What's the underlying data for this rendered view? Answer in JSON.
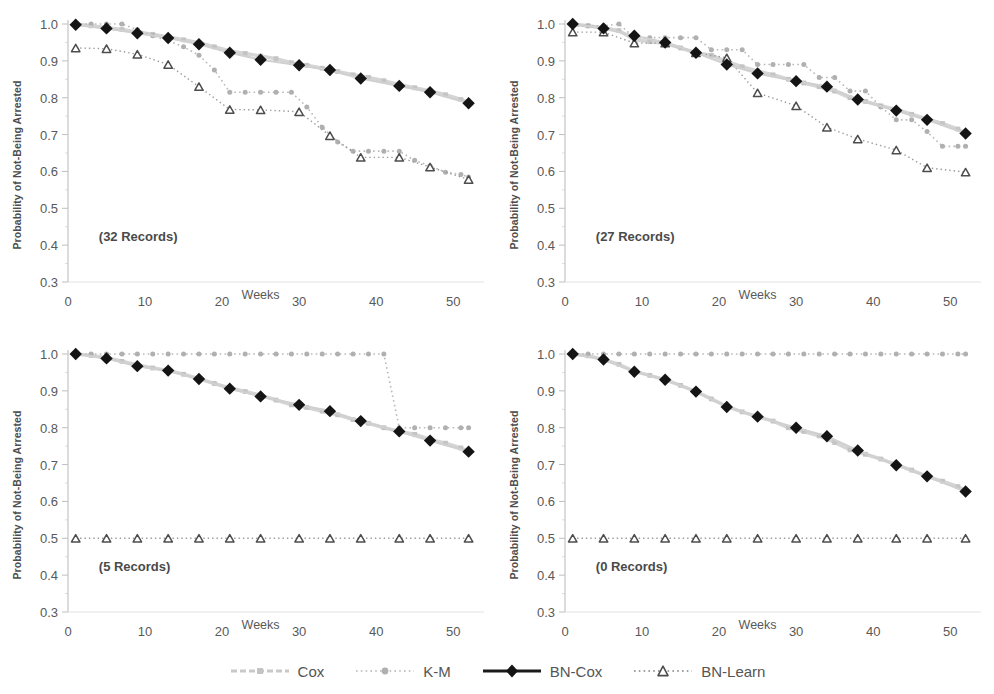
{
  "figure": {
    "axis_label_y": "Probability of Not-Being Arrested",
    "axis_label_x": "Weeks"
  },
  "legend": {
    "items": [
      {
        "label": "Cox",
        "marker": "square",
        "line": "dash",
        "color": "#c9c9c9"
      },
      {
        "label": "K-M",
        "marker": "circle",
        "line": "dot",
        "color": "#b4b4b4"
      },
      {
        "label": "BN-Cox",
        "marker": "diamond",
        "line": "solid",
        "color": "#1a1a1a"
      },
      {
        "label": "BN-Learn",
        "marker": "triangle",
        "line": "dot",
        "color": "#808080"
      }
    ]
  },
  "chart_data": [
    {
      "type": "line",
      "title": "(32 Records)",
      "xlabel": "Weeks",
      "ylabel": "Probability of Not-Being Arrested",
      "xlim": [
        0,
        54
      ],
      "ylim": [
        0.3,
        1.0
      ],
      "xticks": [
        0,
        10,
        20,
        30,
        40,
        50
      ],
      "yticks": [
        0.3,
        0.4,
        0.5,
        0.6,
        0.7,
        0.8,
        0.9,
        1.0
      ],
      "grid": false,
      "legend_position": "bottom",
      "series": [
        {
          "name": "Cox",
          "x": [
            1,
            3,
            5,
            7,
            9,
            11,
            13,
            15,
            17,
            19,
            21,
            23,
            25,
            27,
            29,
            31,
            33,
            35,
            37,
            39,
            41,
            43,
            45,
            47,
            49,
            51,
            52
          ],
          "y": [
            1.0,
            0.995,
            0.99,
            0.985,
            0.978,
            0.972,
            0.965,
            0.957,
            0.949,
            0.938,
            0.927,
            0.92,
            0.913,
            0.906,
            0.895,
            0.888,
            0.88,
            0.871,
            0.862,
            0.855,
            0.846,
            0.835,
            0.827,
            0.818,
            0.808,
            0.795,
            0.786
          ]
        },
        {
          "name": "K-M",
          "x": [
            1,
            3,
            5,
            7,
            9,
            11,
            13,
            15,
            17,
            19,
            21,
            23,
            25,
            27,
            29,
            31,
            33,
            35,
            37,
            39,
            41,
            43,
            45,
            47,
            49,
            51,
            52
          ],
          "y": [
            1.0,
            1.0,
            1.0,
            1.0,
            0.985,
            0.968,
            0.955,
            0.938,
            0.915,
            0.875,
            0.815,
            0.815,
            0.815,
            0.815,
            0.815,
            0.775,
            0.72,
            0.68,
            0.655,
            0.655,
            0.655,
            0.655,
            0.63,
            0.615,
            0.598,
            0.592,
            0.585
          ]
        },
        {
          "name": "BN-Cox",
          "x": [
            1,
            5,
            9,
            13,
            17,
            21,
            25,
            30,
            34,
            38,
            43,
            47,
            52
          ],
          "y": [
            0.998,
            0.988,
            0.975,
            0.962,
            0.945,
            0.922,
            0.903,
            0.888,
            0.875,
            0.852,
            0.832,
            0.815,
            0.785
          ]
        },
        {
          "name": "BN-Learn",
          "x": [
            1,
            5,
            9,
            13,
            17,
            21,
            25,
            30,
            34,
            38,
            43,
            47,
            52
          ],
          "y": [
            0.935,
            0.933,
            0.918,
            0.89,
            0.83,
            0.768,
            0.767,
            0.762,
            0.697,
            0.638,
            0.638,
            0.612,
            0.578
          ]
        }
      ]
    },
    {
      "type": "line",
      "title": "(27 Records)",
      "xlabel": "Weeks",
      "ylabel": "Probability of Not-Being Arrested",
      "xlim": [
        0,
        54
      ],
      "ylim": [
        0.3,
        1.0
      ],
      "xticks": [
        0,
        10,
        20,
        30,
        40,
        50
      ],
      "yticks": [
        0.3,
        0.4,
        0.5,
        0.6,
        0.7,
        0.8,
        0.9,
        1.0
      ],
      "grid": false,
      "legend_position": "bottom",
      "series": [
        {
          "name": "Cox",
          "x": [
            1,
            3,
            5,
            7,
            9,
            11,
            13,
            15,
            17,
            19,
            21,
            23,
            25,
            27,
            29,
            31,
            33,
            35,
            37,
            39,
            41,
            43,
            45,
            47,
            49,
            51,
            52
          ],
          "y": [
            1.0,
            0.995,
            0.99,
            0.982,
            0.958,
            0.952,
            0.948,
            0.935,
            0.922,
            0.915,
            0.898,
            0.884,
            0.872,
            0.862,
            0.85,
            0.84,
            0.83,
            0.818,
            0.8,
            0.79,
            0.778,
            0.768,
            0.755,
            0.742,
            0.73,
            0.715,
            0.703
          ]
        },
        {
          "name": "K-M",
          "x": [
            1,
            3,
            5,
            7,
            9,
            11,
            13,
            15,
            17,
            19,
            21,
            23,
            25,
            27,
            29,
            31,
            33,
            35,
            37,
            39,
            41,
            43,
            45,
            47,
            49,
            51,
            52
          ],
          "y": [
            0.995,
            0.995,
            0.995,
            1.0,
            0.963,
            0.963,
            0.963,
            0.963,
            0.963,
            0.93,
            0.93,
            0.93,
            0.89,
            0.89,
            0.89,
            0.89,
            0.855,
            0.855,
            0.818,
            0.818,
            0.775,
            0.74,
            0.74,
            0.708,
            0.668,
            0.668,
            0.668
          ]
        },
        {
          "name": "BN-Cox",
          "x": [
            1,
            5,
            9,
            13,
            17,
            21,
            25,
            30,
            34,
            38,
            43,
            47,
            52
          ],
          "y": [
            1.0,
            0.988,
            0.968,
            0.95,
            0.922,
            0.89,
            0.866,
            0.845,
            0.83,
            0.795,
            0.765,
            0.74,
            0.703
          ]
        },
        {
          "name": "BN-Learn",
          "x": [
            1,
            5,
            9,
            13,
            17,
            21,
            25,
            30,
            34,
            38,
            43,
            47,
            52
          ],
          "y": [
            0.978,
            0.978,
            0.948,
            0.948,
            0.922,
            0.908,
            0.813,
            0.778,
            0.72,
            0.688,
            0.658,
            0.61,
            0.598
          ]
        }
      ]
    },
    {
      "type": "line",
      "title": "(5 Records)",
      "xlabel": "Weeks",
      "ylabel": "Probability of Not-Being Arrested",
      "xlim": [
        0,
        54
      ],
      "ylim": [
        0.3,
        1.0
      ],
      "xticks": [
        0,
        10,
        20,
        30,
        40,
        50
      ],
      "yticks": [
        0.3,
        0.4,
        0.5,
        0.6,
        0.7,
        0.8,
        0.9,
        1.0
      ],
      "grid": false,
      "legend_position": "bottom",
      "series": [
        {
          "name": "Cox",
          "x": [
            1,
            3,
            5,
            7,
            9,
            11,
            13,
            15,
            17,
            19,
            21,
            23,
            25,
            27,
            29,
            31,
            33,
            35,
            37,
            39,
            41,
            43,
            45,
            47,
            49,
            51,
            52
          ],
          "y": [
            1.0,
            0.996,
            0.99,
            0.98,
            0.97,
            0.962,
            0.955,
            0.945,
            0.933,
            0.92,
            0.908,
            0.898,
            0.888,
            0.875,
            0.862,
            0.855,
            0.845,
            0.835,
            0.822,
            0.812,
            0.8,
            0.79,
            0.782,
            0.768,
            0.758,
            0.745,
            0.735
          ]
        },
        {
          "name": "K-M",
          "x": [
            1,
            3,
            5,
            7,
            9,
            11,
            13,
            15,
            17,
            19,
            21,
            23,
            25,
            27,
            29,
            31,
            33,
            35,
            37,
            39,
            41,
            43,
            45,
            47,
            49,
            51,
            52
          ],
          "y": [
            1.0,
            1.0,
            1.0,
            1.0,
            1.0,
            1.0,
            1.0,
            1.0,
            1.0,
            1.0,
            1.0,
            1.0,
            1.0,
            1.0,
            1.0,
            1.0,
            1.0,
            1.0,
            1.0,
            1.0,
            1.0,
            0.8,
            0.8,
            0.8,
            0.8,
            0.8,
            0.8
          ]
        },
        {
          "name": "BN-Cox",
          "x": [
            1,
            5,
            9,
            13,
            17,
            21,
            25,
            30,
            34,
            38,
            43,
            47,
            52
          ],
          "y": [
            1.0,
            0.988,
            0.967,
            0.955,
            0.932,
            0.906,
            0.885,
            0.862,
            0.845,
            0.818,
            0.79,
            0.765,
            0.735
          ]
        },
        {
          "name": "BN-Learn",
          "x": [
            1,
            5,
            9,
            13,
            17,
            21,
            25,
            30,
            34,
            38,
            43,
            47,
            52
          ],
          "y": [
            0.5,
            0.5,
            0.5,
            0.5,
            0.5,
            0.5,
            0.5,
            0.5,
            0.5,
            0.5,
            0.5,
            0.5,
            0.5
          ]
        }
      ]
    },
    {
      "type": "line",
      "title": "(0 Records)",
      "xlabel": "Weeks",
      "ylabel": "Probability of Not-Being Arrested",
      "xlim": [
        0,
        54
      ],
      "ylim": [
        0.3,
        1.0
      ],
      "xticks": [
        0,
        10,
        20,
        30,
        40,
        50
      ],
      "yticks": [
        0.3,
        0.4,
        0.5,
        0.6,
        0.7,
        0.8,
        0.9,
        1.0
      ],
      "grid": false,
      "legend_position": "bottom",
      "series": [
        {
          "name": "Cox",
          "x": [
            1,
            3,
            5,
            7,
            9,
            11,
            13,
            15,
            17,
            19,
            21,
            23,
            25,
            27,
            29,
            31,
            33,
            35,
            37,
            39,
            41,
            43,
            45,
            47,
            49,
            51,
            52
          ],
          "y": [
            1.0,
            0.995,
            0.985,
            0.972,
            0.953,
            0.942,
            0.93,
            0.915,
            0.898,
            0.878,
            0.858,
            0.843,
            0.83,
            0.818,
            0.8,
            0.79,
            0.778,
            0.76,
            0.74,
            0.728,
            0.715,
            0.7,
            0.685,
            0.668,
            0.655,
            0.64,
            0.628
          ]
        },
        {
          "name": "K-M",
          "x": [
            1,
            3,
            5,
            7,
            9,
            11,
            13,
            15,
            17,
            19,
            21,
            23,
            25,
            27,
            29,
            31,
            33,
            35,
            37,
            39,
            41,
            43,
            45,
            47,
            49,
            51,
            52
          ],
          "y": [
            1.0,
            1.0,
            1.0,
            1.0,
            1.0,
            1.0,
            1.0,
            1.0,
            1.0,
            1.0,
            1.0,
            1.0,
            1.0,
            1.0,
            1.0,
            1.0,
            1.0,
            1.0,
            1.0,
            1.0,
            1.0,
            1.0,
            1.0,
            1.0,
            1.0,
            1.0,
            1.0
          ]
        },
        {
          "name": "BN-Cox",
          "x": [
            1,
            5,
            9,
            13,
            17,
            21,
            25,
            30,
            34,
            38,
            43,
            47,
            52
          ],
          "y": [
            1.0,
            0.985,
            0.952,
            0.93,
            0.898,
            0.856,
            0.83,
            0.8,
            0.777,
            0.738,
            0.698,
            0.668,
            0.627
          ]
        },
        {
          "name": "BN-Learn",
          "x": [
            1,
            5,
            9,
            13,
            17,
            21,
            25,
            30,
            34,
            38,
            43,
            47,
            52
          ],
          "y": [
            0.5,
            0.5,
            0.5,
            0.5,
            0.5,
            0.5,
            0.5,
            0.5,
            0.5,
            0.5,
            0.5,
            0.5,
            0.5
          ]
        }
      ]
    }
  ]
}
